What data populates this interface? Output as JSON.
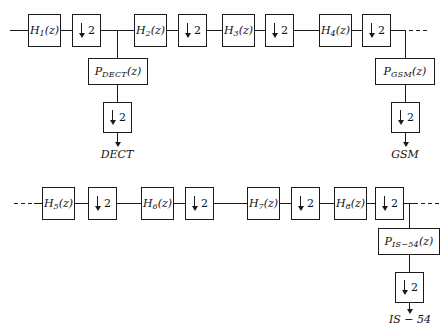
{
  "figure": {
    "type": "block-diagram"
  },
  "row1": {
    "filters": [
      {
        "label": "H",
        "sub": "1",
        "arg": "(z)"
      },
      {
        "label": "H",
        "sub": "2",
        "arg": "(z)"
      },
      {
        "label": "H",
        "sub": "3",
        "arg": "(z)"
      },
      {
        "label": "H",
        "sub": "4",
        "arg": "(z)"
      }
    ],
    "decimators": [
      {
        "factor": "2"
      },
      {
        "factor": "2"
      },
      {
        "factor": "2"
      },
      {
        "factor": "2"
      }
    ],
    "trailing_ellipsis": "..."
  },
  "row2": {
    "leading_ellipsis": "...",
    "filters": [
      {
        "label": "H",
        "sub": "5",
        "arg": "(z)"
      },
      {
        "label": "H",
        "sub": "6",
        "arg": "(z)"
      },
      {
        "label": "H",
        "sub": "7",
        "arg": "(z)"
      },
      {
        "label": "H",
        "sub": "8",
        "arg": "(z)"
      }
    ],
    "decimators": [
      {
        "factor": "2"
      },
      {
        "factor": "2"
      },
      {
        "factor": "2"
      },
      {
        "factor": "2"
      }
    ],
    "trailing_ellipsis": "..."
  },
  "branches": [
    {
      "id": "dect",
      "pfilter": {
        "label": "P",
        "sub": "DECT",
        "arg": "(z)"
      },
      "decimator": {
        "factor": "2"
      },
      "output": "DECT"
    },
    {
      "id": "gsm",
      "pfilter": {
        "label": "P",
        "sub": "GSM",
        "arg": "(z)"
      },
      "decimator": {
        "factor": "2"
      },
      "output": "GSM"
    },
    {
      "id": "is54",
      "pfilter": {
        "label": "P",
        "sub": "IS−54",
        "arg": "(z)"
      },
      "decimator": {
        "factor": "2"
      },
      "output": "IS − 54"
    }
  ],
  "colors": {
    "line": "#1a1a1a",
    "background": "#ffffff",
    "text": "#111111"
  }
}
